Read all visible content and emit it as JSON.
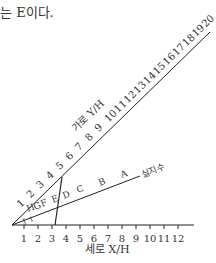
{
  "caption": "는 E이다.",
  "diagram": {
    "x_axis": {
      "label": "세로 X/H",
      "ticks": [
        "1",
        "2",
        "3",
        "4",
        "5",
        "6",
        "7",
        "8",
        "9",
        "10",
        "11",
        "12"
      ]
    },
    "diag_axis": {
      "label": "가로 Y/H",
      "ticks": [
        "1",
        "2",
        "3",
        "4",
        "5",
        "6",
        "7",
        "8",
        "9",
        "10",
        "11",
        "12",
        "13",
        "14",
        "15",
        "16",
        "17",
        "18",
        "19",
        "20"
      ]
    },
    "index_line": {
      "label": "실지수",
      "letters": [
        "J",
        "I",
        "H",
        "G",
        "F",
        "E",
        "D",
        "C",
        "B",
        "A"
      ]
    },
    "colors": {
      "line": "#222222",
      "text": "#333333"
    }
  }
}
